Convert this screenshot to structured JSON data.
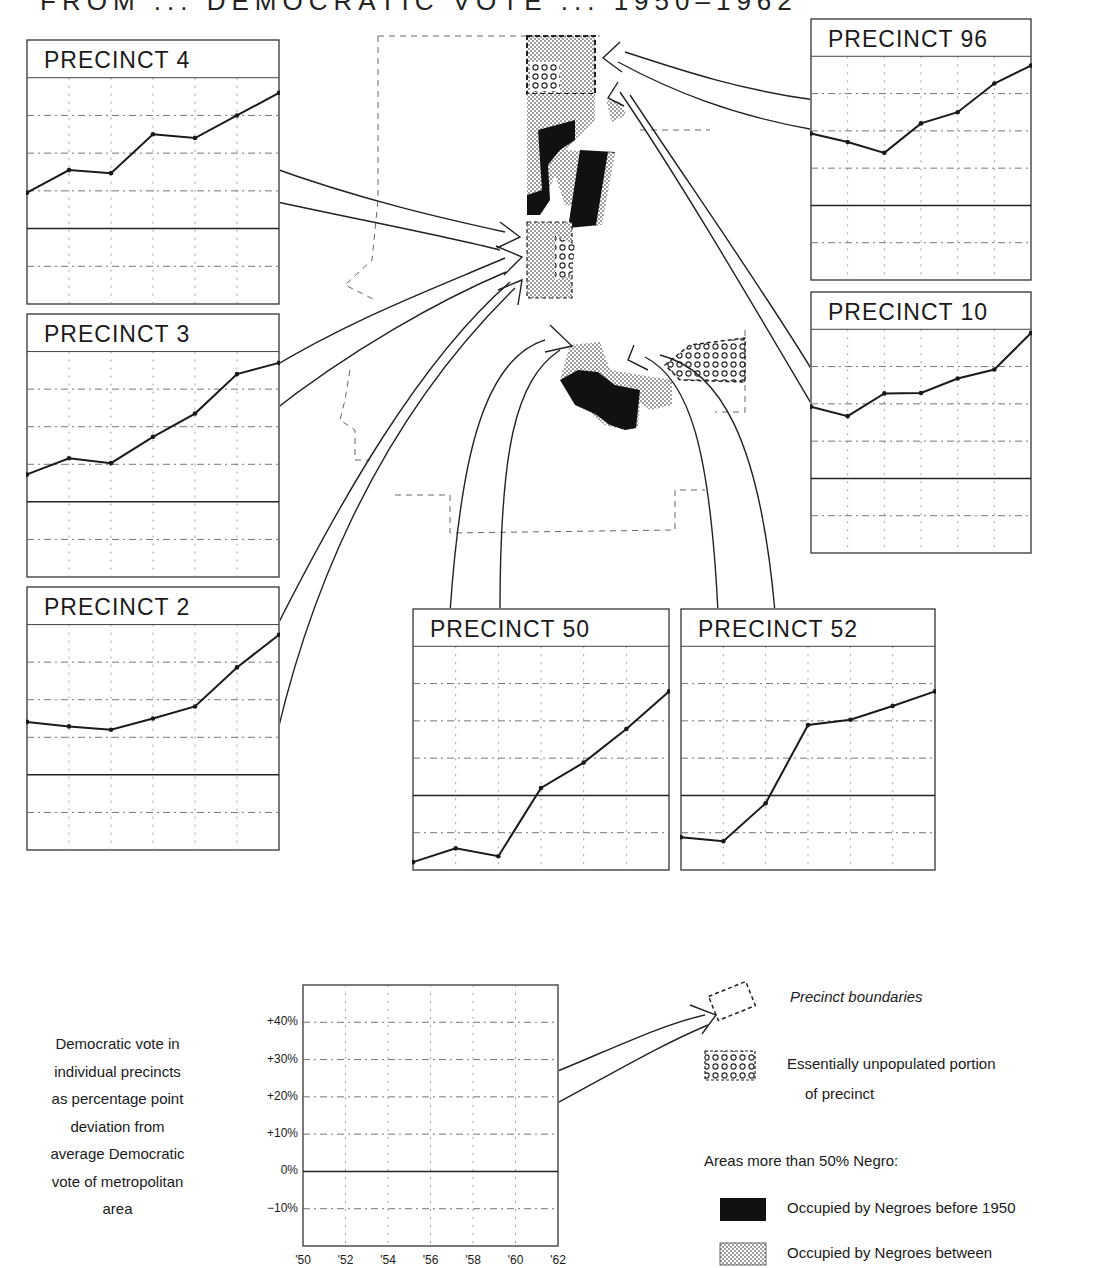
{
  "header": {
    "title_partial": "FROM ... DEMOCRATIC VOTE ... 1950–1962"
  },
  "axis": {
    "y_ticks": [
      "+40%",
      "+30%",
      "+20%",
      "+10%",
      "0%",
      "−10%"
    ],
    "x_ticks": [
      "'50",
      "'52",
      "'54",
      "'56",
      "'58",
      "'60",
      "'62"
    ]
  },
  "caption": {
    "lines": [
      "Democratic vote in",
      "individual precincts",
      "as percentage point",
      "deviation from",
      "average Democratic",
      "vote of metropolitan",
      "area"
    ]
  },
  "legend": {
    "precinct_boundaries": "Precinct boundaries",
    "unpopulated_1": "Essentially unpopulated portion",
    "unpopulated_2": "of precinct",
    "areas_heading": "Areas more than 50% Negro:",
    "before_1950": "Occupied by Negroes before 1950",
    "between": "Occupied by Negroes between"
  },
  "colors": {
    "ink": "#1a1a1a",
    "grid": "#555555",
    "paper": "#ffffff"
  },
  "chart_data": {
    "type": "line",
    "title": "Democratic vote in individual precincts as percentage point deviation from average Democratic vote of metropolitan area",
    "xlabel": "Election year",
    "ylabel": "Percentage point deviation",
    "x": [
      "'50",
      "'52",
      "'54",
      "'56",
      "'58",
      "'60",
      "'62"
    ],
    "ylim": [
      -20,
      50
    ],
    "grid": true,
    "series": [
      {
        "name": "PRECINCT 4",
        "values": [
          9.5,
          15.5,
          14.7,
          25.0,
          24.0,
          30.0,
          36.0
        ]
      },
      {
        "name": "PRECINCT 3",
        "values": [
          7.3,
          11.6,
          10.3,
          17.3,
          23.5,
          34.0,
          37.0
        ]
      },
      {
        "name": "PRECINCT 2",
        "values": [
          14.1,
          12.9,
          12.0,
          15.0,
          18.2,
          28.6,
          37.3
        ]
      },
      {
        "name": "PRECINCT 96",
        "values": [
          19.3,
          17.0,
          14.1,
          22.0,
          25.0,
          32.7,
          37.5
        ]
      },
      {
        "name": "PRECINCT 10",
        "values": [
          19.2,
          16.7,
          22.8,
          22.9,
          26.8,
          29.2,
          39.0
        ]
      },
      {
        "name": "PRECINCT 50",
        "values": [
          -17.9,
          -14.2,
          -16.3,
          2.0,
          8.8,
          17.8,
          27.9
        ]
      },
      {
        "name": "PRECINCT 52",
        "values": [
          -11.2,
          -12.3,
          -2.1,
          18.9,
          20.3,
          24.0,
          27.9
        ]
      }
    ]
  },
  "charts": [
    {
      "key": "p4",
      "label": "PRECINCT  4",
      "x": 26,
      "y": 39,
      "w": 252,
      "h": 264,
      "series": 0
    },
    {
      "key": "p3",
      "label": "PRECINCT  3",
      "x": 26,
      "y": 313,
      "w": 252,
      "h": 263,
      "series": 1
    },
    {
      "key": "p2",
      "label": "PRECINCT  2",
      "x": 26,
      "y": 586,
      "w": 252,
      "h": 263,
      "series": 2
    },
    {
      "key": "p96",
      "label": "PRECINCT  96",
      "x": 810,
      "y": 18,
      "w": 220,
      "h": 261,
      "series": 3
    },
    {
      "key": "p10",
      "label": "PRECINCT  10",
      "x": 810,
      "y": 291,
      "w": 220,
      "h": 261,
      "series": 4
    },
    {
      "key": "p50",
      "label": "PRECINCT  50",
      "x": 412,
      "y": 608,
      "w": 256,
      "h": 261,
      "series": 5
    },
    {
      "key": "p52",
      "label": "PRECINCT  52",
      "x": 680,
      "y": 608,
      "w": 254,
      "h": 261,
      "series": 6
    }
  ],
  "key_chart": {
    "x": 302,
    "y": 984,
    "w": 255,
    "h": 261
  }
}
